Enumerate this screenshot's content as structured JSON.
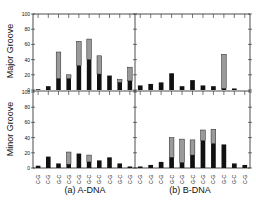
{
  "chart_data": {
    "type": "bar",
    "stacked": true,
    "layout": "2x2 panels",
    "columns": [
      {
        "label": "(a) A-DNA"
      },
      {
        "label": "(b) B-DNA"
      }
    ],
    "rows": [
      {
        "label": "Major Groove"
      },
      {
        "label": "Minor Groove"
      }
    ],
    "yticks": [
      0,
      20,
      40,
      60,
      80,
      100
    ],
    "ylim": [
      0,
      100
    ],
    "series_colors": {
      "dark": "#111111",
      "gray": "#9a9a9a"
    },
    "panels": [
      {
        "id": "a-major",
        "column": "(a) A-DNA",
        "row": "Major Groove",
        "categories": [
          "C-G",
          "C-G",
          "G-C",
          "C-G",
          "C-G",
          "G-C",
          "G-C",
          "C-G",
          "G-C",
          "C-G"
        ],
        "dark": [
          1,
          5,
          15,
          15,
          32,
          40,
          21,
          19,
          10,
          12
        ],
        "total": [
          1,
          5,
          50,
          20,
          64,
          67,
          45,
          19,
          14,
          30
        ]
      },
      {
        "id": "b-major",
        "column": "(b) B-DNA",
        "row": "Major Groove",
        "categories": [
          "C-G",
          "C-G",
          "C-G",
          "G-C",
          "C-G",
          "G-C",
          "C-G",
          "C-G",
          "G-C",
          "G-C",
          "C-G"
        ],
        "dark": [
          6,
          8,
          10,
          22,
          5,
          13,
          6,
          5,
          2,
          2,
          0
        ],
        "total": [
          6,
          8,
          10,
          22,
          5,
          13,
          6,
          5,
          47,
          2,
          0
        ]
      },
      {
        "id": "a-minor",
        "column": "(a) A-DNA",
        "row": "Minor Groove",
        "categories": [
          "C-G",
          "C-G",
          "G-C",
          "C-G",
          "C-G",
          "G-C",
          "G-C",
          "C-G",
          "G-C",
          "C-G"
        ],
        "dark": [
          3,
          15,
          6,
          5,
          19,
          8,
          10,
          14,
          6,
          2
        ],
        "total": [
          3,
          15,
          6,
          21,
          19,
          17,
          10,
          14,
          6,
          2
        ]
      },
      {
        "id": "b-minor",
        "column": "(b) B-DNA",
        "row": "Minor Groove",
        "categories": [
          "C-G",
          "C-G",
          "C-G",
          "G-C",
          "C-G",
          "G-C",
          "C-G",
          "C-G",
          "G-C",
          "G-C",
          "C-G"
        ],
        "dark": [
          2,
          4,
          8,
          14,
          7,
          17,
          36,
          32,
          31,
          6,
          4
        ],
        "total": [
          2,
          4,
          8,
          40,
          38,
          37,
          50,
          51,
          31,
          6,
          4
        ]
      }
    ]
  },
  "labels": {
    "major_ylabel": "Major Groove",
    "minor_ylabel": "Minor Groove",
    "caption_a": "(a) A-DNA",
    "caption_b": "(b) B-DNA"
  }
}
